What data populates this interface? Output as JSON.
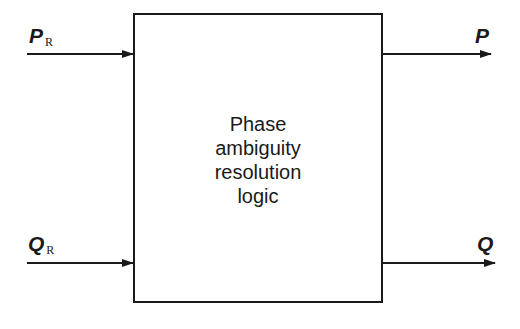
{
  "diagram": {
    "block": {
      "label_lines": [
        "Phase",
        "ambiguity",
        "resolution",
        "logic"
      ]
    },
    "inputs": [
      {
        "symbol": "P",
        "subscript": "R"
      },
      {
        "symbol": "Q",
        "subscript": "R"
      }
    ],
    "outputs": [
      {
        "symbol": "P"
      },
      {
        "symbol": "Q"
      }
    ],
    "colors": {
      "line": "#1a1a1a",
      "background": "#ffffff"
    }
  }
}
